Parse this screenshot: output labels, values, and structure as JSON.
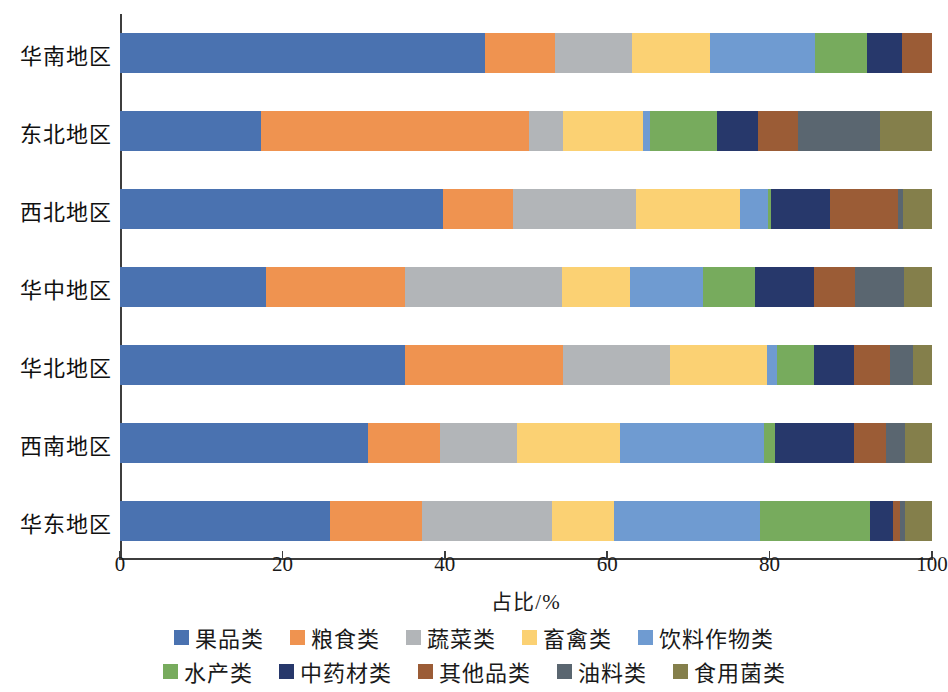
{
  "chart_data": {
    "type": "bar",
    "subtype": "horizontal-stacked-percentage",
    "title": "",
    "xlabel": "占比/%",
    "ylabel": "",
    "xlim": [
      0,
      100
    ],
    "xticks": [
      0,
      20,
      40,
      60,
      80,
      100
    ],
    "xtick_labels": [
      "0",
      "20",
      "40",
      "60",
      "80",
      "100"
    ],
    "grid": false,
    "legend_position": "bottom",
    "categories": [
      "华南地区",
      "东北地区",
      "西北地区",
      "华中地区",
      "华北地区",
      "西南地区",
      "华东地区"
    ],
    "series": [
      {
        "name": "果品类",
        "color": "#4a72b0",
        "values": [
          45.0,
          17.4,
          39.8,
          18.0,
          35.1,
          30.5,
          25.9
        ]
      },
      {
        "name": "粮食类",
        "color": "#ef9350",
        "values": [
          8.6,
          33.0,
          8.6,
          17.1,
          19.5,
          8.9,
          11.3
        ]
      },
      {
        "name": "蔬菜类",
        "color": "#b2b5b8",
        "values": [
          9.4,
          4.2,
          15.1,
          19.3,
          13.1,
          9.5,
          16.0
        ]
      },
      {
        "name": "畜禽类",
        "color": "#fbd173",
        "values": [
          9.7,
          9.8,
          12.9,
          8.4,
          12.0,
          12.7,
          7.6
        ]
      },
      {
        "name": "饮料作物类",
        "color": "#6f9bd1",
        "values": [
          12.9,
          0.9,
          3.4,
          9.0,
          1.2,
          17.7,
          18.0
        ]
      },
      {
        "name": "水产类",
        "color": "#77ab5d",
        "values": [
          6.4,
          8.2,
          0.4,
          6.4,
          4.6,
          1.4,
          13.6
        ]
      },
      {
        "name": "中药材类",
        "color": "#27386b",
        "values": [
          4.3,
          5.1,
          7.2,
          7.3,
          4.9,
          9.7,
          2.8
        ]
      },
      {
        "name": "其他品类",
        "color": "#9b5c36",
        "values": [
          3.7,
          4.9,
          8.4,
          5.0,
          4.4,
          3.9,
          0.9
        ]
      },
      {
        "name": "油料类",
        "color": "#5a6670",
        "values": [
          0.0,
          10.1,
          0.6,
          6.1,
          2.9,
          2.4,
          0.6
        ]
      },
      {
        "name": "食用菌类",
        "color": "#847f4b",
        "values": [
          0.0,
          6.4,
          3.6,
          3.4,
          2.3,
          3.3,
          3.3
        ]
      }
    ]
  },
  "axis": {
    "x_title": "占比/%"
  }
}
